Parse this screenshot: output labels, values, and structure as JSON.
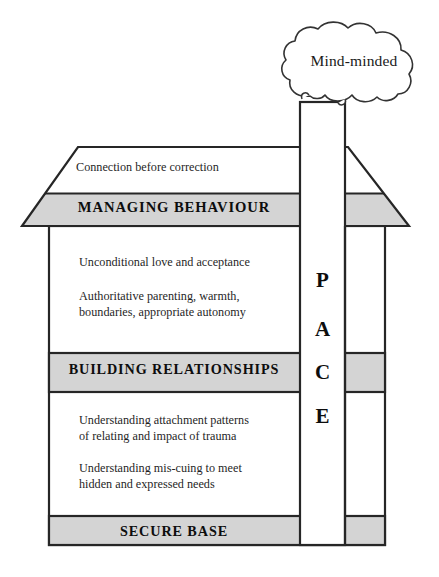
{
  "diagram": {
    "colors": {
      "band_fill": "#d4d4d4",
      "outline": "#262626",
      "paper": "#ffffff",
      "text": "#1a1a1a"
    },
    "cloud": {
      "label": "Mind-minded"
    },
    "chimney": {
      "letters": [
        "P",
        "A",
        "C",
        "E"
      ],
      "word": "PACE"
    },
    "roof": {
      "note": "Connection before correction",
      "band_label": "MANAGING BEHAVIOUR"
    },
    "upper_storey": {
      "band_label": "BUILDING RELATIONSHIPS",
      "notes": [
        "Unconditional love and acceptance",
        "Authoritative parenting, warmth,\nboundaries, appropriate autonomy"
      ]
    },
    "lower_storey": {
      "band_label": "SECURE BASE",
      "notes": [
        "Understanding attachment patterns\nof relating and impact of trauma",
        "Understanding mis-cuing to meet\nhidden and expressed needs"
      ]
    },
    "notes_flat": {
      "roof_note": "Connection before correction",
      "unconditional": "Unconditional love and acceptance",
      "authoritative_line1": "Authoritative parenting, warmth,",
      "authoritative_line2": "boundaries, appropriate autonomy",
      "attachment_line1": "Understanding attachment patterns",
      "attachment_line2": "of relating and impact of trauma",
      "miscuing_line1": "Understanding mis-cuing to meet",
      "miscuing_line2": "hidden and expressed needs"
    },
    "bands": {
      "managing": "MANAGING BEHAVIOUR",
      "building": "BUILDING RELATIONSHIPS",
      "secure": "SECURE BASE"
    }
  }
}
